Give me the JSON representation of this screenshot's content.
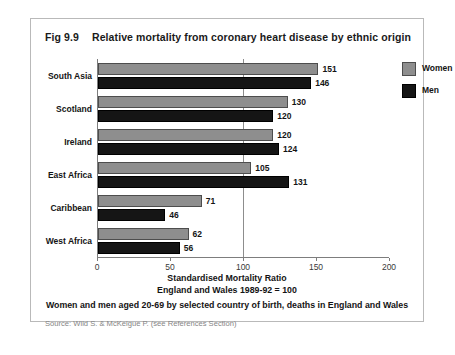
{
  "figure": {
    "number": "Fig 9.9",
    "title": "Relative mortality from coronary heart disease by ethnic origin",
    "axis_title_line1": "Standardised Mortality Ratio",
    "axis_title_line2": "England and Wales 1989-92 = 100",
    "subtitle": "Women and men aged 20-69 by selected country of birth, deaths in England and Wales",
    "source": "Source:  Wild S. & McKeigue P. (see References Section)"
  },
  "legend": {
    "items": [
      {
        "label": "Women",
        "color": "#8e8e8e"
      },
      {
        "label": "Men",
        "color": "#151515"
      }
    ]
  },
  "chart_data": {
    "type": "bar",
    "orientation": "horizontal",
    "title": "Relative mortality from coronary heart disease by ethnic origin",
    "subtitle": "Women and men aged 20-69 by selected country of birth, deaths in England and Wales",
    "xlabel": "Standardised Mortality Ratio England and Wales 1989-92 = 100",
    "ylabel": "",
    "categories": [
      "South Asia",
      "Scotland",
      "Ireland",
      "East Africa",
      "Caribbean",
      "West Africa"
    ],
    "series": [
      {
        "name": "Women",
        "color": "#8e8e8e",
        "values": [
          151,
          130,
          120,
          105,
          71,
          62
        ]
      },
      {
        "name": "Men",
        "color": "#151515",
        "values": [
          146,
          120,
          124,
          131,
          46,
          56
        ]
      }
    ],
    "xlim": [
      0,
      200
    ],
    "xticks": [
      0,
      50,
      100,
      150,
      200
    ],
    "xtick_labels": [
      "0",
      "50",
      "100",
      "150",
      "200"
    ],
    "reference_line": 100,
    "grid": false,
    "legend_position": "top-right",
    "data_labels": true
  }
}
